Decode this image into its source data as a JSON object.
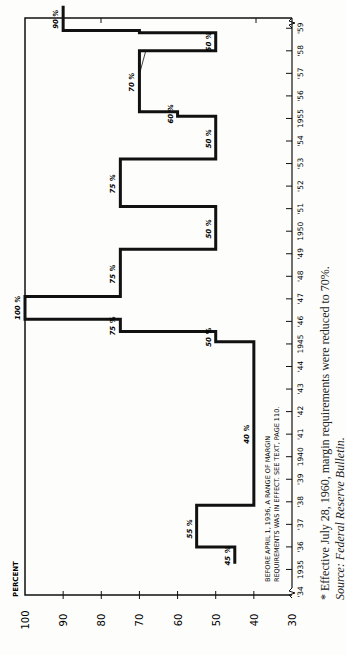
{
  "chart_data": {
    "type": "line",
    "subtype": "step",
    "orientation": "rotated-90-ccw",
    "ylabel": "PERCENT",
    "xlabel": "",
    "ylim": [
      30,
      100
    ],
    "yticks": [
      100,
      90,
      80,
      70,
      60,
      50,
      40,
      30
    ],
    "xticks": [
      "'34",
      "1935",
      "'36",
      "'37",
      "'38",
      "'39",
      "1940",
      "'41",
      "'42",
      "'43",
      "'44",
      "1945",
      "'46",
      "'47",
      "'48",
      "'49",
      "1950",
      "'51",
      "'52",
      "'53",
      "'54",
      "1955",
      "'56",
      "'57",
      "'58",
      "'59"
    ],
    "grid": false,
    "series": [
      {
        "name": "Margin requirements",
        "steps": [
          {
            "from": 1935.25,
            "to": 1936.0,
            "value": 45
          },
          {
            "from": 1936.0,
            "to": 1937.85,
            "value": 55
          },
          {
            "from": 1937.85,
            "to": 1945.1,
            "value": 40
          },
          {
            "from": 1945.1,
            "to": 1945.55,
            "value": 50
          },
          {
            "from": 1945.55,
            "to": 1946.1,
            "value": 75
          },
          {
            "from": 1946.1,
            "to": 1947.1,
            "value": 100
          },
          {
            "from": 1947.1,
            "to": 1949.2,
            "value": 75
          },
          {
            "from": 1949.2,
            "to": 1951.1,
            "value": 50
          },
          {
            "from": 1951.1,
            "to": 1953.2,
            "value": 75
          },
          {
            "from": 1953.2,
            "to": 1955.1,
            "value": 50
          },
          {
            "from": 1955.1,
            "to": 1955.3,
            "value": 60
          },
          {
            "from": 1955.3,
            "to": 1958.0,
            "value": 70
          },
          {
            "from": 1958.0,
            "to": 1958.8,
            "value": 50
          },
          {
            "from": 1958.8,
            "to": 1958.9,
            "value": 70
          },
          {
            "from": 1958.9,
            "to": 1960.0,
            "value": 90
          }
        ]
      }
    ],
    "annotations": [
      {
        "text": "45 %",
        "year": 1935.6,
        "value": 45
      },
      {
        "text": "55 %",
        "year": 1936.8,
        "value": 55
      },
      {
        "text": "40 %",
        "year": 1941.0,
        "value": 40
      },
      {
        "text": "50 %",
        "year": 1945.3,
        "value": 50
      },
      {
        "text": "75 %",
        "year": 1945.8,
        "value": 75
      },
      {
        "text": "100 %",
        "year": 1946.6,
        "value": 100
      },
      {
        "text": "75 %",
        "year": 1948.1,
        "value": 75
      },
      {
        "text": "50 %",
        "year": 1950.1,
        "value": 50
      },
      {
        "text": "75 %",
        "year": 1952.1,
        "value": 75
      },
      {
        "text": "50 %",
        "year": 1954.1,
        "value": 50
      },
      {
        "text": "60 %",
        "year": 1955.2,
        "value": 60
      },
      {
        "text": "70 %",
        "year": 1956.6,
        "value": 70
      },
      {
        "text": "50 %",
        "year": 1958.4,
        "value": 50
      },
      {
        "text": "90 %",
        "year": 1959.4,
        "value": 90
      }
    ],
    "note": "BEFORE APRIL 1, 1936, A RANGE OF MARGIN REQUIREMENTS WAS IN EFFECT. SEE TEXT, PAGE 110."
  },
  "chart_text": {
    "ylabel": "PERCENT",
    "note_line1": "BEFORE APRIL 1, 1936, A RANGE OF MARGIN",
    "note_line2": "REQUIREMENTS WAS IN EFFECT. SEE TEXT, PAGE 110."
  },
  "footnote": "* Effective July 28, 1960, margin requirements were reduced to 70%.",
  "source": "Source: Federal Reserve Bulletin."
}
